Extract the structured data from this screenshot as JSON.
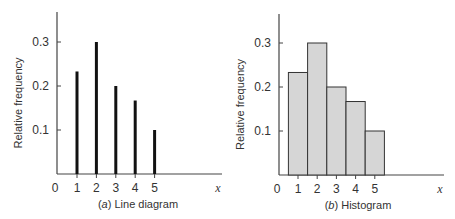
{
  "chart_data": [
    {
      "type": "bar",
      "subtype": "line-diagram",
      "title": "(a) Line diagram",
      "caption_letter": "a",
      "caption_text": "Line diagram",
      "xlabel": "x",
      "ylabel": "Relative frequency",
      "categories": [
        1,
        2,
        3,
        4,
        5
      ],
      "values": [
        0.233,
        0.3,
        0.2,
        0.167,
        0.1
      ],
      "x_ticks": [
        "0",
        "1",
        "2",
        "3",
        "4",
        "5"
      ],
      "y_ticks": [
        "0.1",
        "0.2",
        "0.3"
      ],
      "ylim": [
        0,
        0.36
      ],
      "grid": false
    },
    {
      "type": "bar",
      "subtype": "histogram",
      "title": "(b) Histogram",
      "caption_letter": "b",
      "caption_text": "Histogram",
      "xlabel": "x",
      "ylabel": "Relative frequency",
      "categories": [
        1,
        2,
        3,
        4,
        5
      ],
      "values": [
        0.233,
        0.3,
        0.2,
        0.167,
        0.1
      ],
      "x_ticks": [
        "0",
        "1",
        "2",
        "3",
        "4",
        "5"
      ],
      "y_ticks": [
        "0.1",
        "0.2",
        "0.3"
      ],
      "ylim": [
        0,
        0.36
      ],
      "grid": false,
      "bar_color": "#d6d6d6"
    }
  ]
}
